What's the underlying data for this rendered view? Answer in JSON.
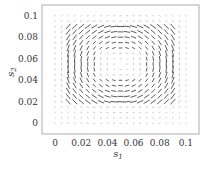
{
  "chart_data": {
    "type": "quiver",
    "title": "",
    "xlabel": "s1",
    "ylabel": "s2",
    "xlim": [
      -0.01,
      0.11
    ],
    "ylim": [
      -0.01,
      0.11
    ],
    "xticks": [
      "0",
      "0.02",
      "0.04",
      "0.06",
      "0.08",
      "0.1"
    ],
    "yticks": [
      "0",
      "0.02",
      "0.04",
      "0.06",
      "0.08",
      "0.1"
    ],
    "grid": false,
    "legend": null,
    "field_description": "Vector field on a grid from 0 to 0.1 in both axes; vectors circulate clockwise around center (~0.05,0.055), strongest near edges of the inner square (0.01-0.09), near-zero outside and at center.",
    "grid_spacing": 0.005
  }
}
